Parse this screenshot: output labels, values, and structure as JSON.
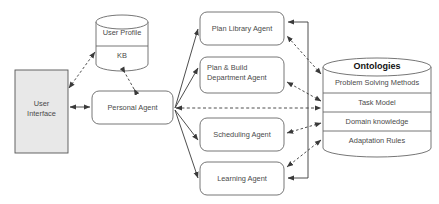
{
  "diagram": {
    "type": "block-diagram",
    "background_color": "#ffffff",
    "stroke_color": "#555555",
    "text_color": "#4a4a4a",
    "fill_color": "#e8e8e8"
  },
  "nodes": {
    "user_interface": {
      "label": "User\nInterface",
      "shape": "rectangle",
      "fill": "#e8e8e8"
    },
    "user_profile_kb": {
      "shape": "cylinder",
      "sections": [
        {
          "label": "User Profile"
        },
        {
          "label": "KB"
        }
      ]
    },
    "personal_agent": {
      "label": "Personal Agent",
      "shape": "rounded-rectangle"
    },
    "plan_library_agent": {
      "label": "Plan Library Agent",
      "shape": "rounded-rectangle"
    },
    "plan_build_department_agent": {
      "label": "Plan & Build\nDepartment Agent",
      "shape": "rounded-rectangle"
    },
    "scheduling_agent": {
      "label": "Scheduling Agent",
      "shape": "rounded-rectangle"
    },
    "learning_agent": {
      "label": "Learning Agent",
      "shape": "rounded-rectangle"
    },
    "ontologies": {
      "title": "Ontologies",
      "shape": "cylinder",
      "sections": [
        {
          "label": "Problem Solving Methods"
        },
        {
          "label": "Task Model"
        },
        {
          "label": "Domain knowledge"
        },
        {
          "label": "Adaptation Rules"
        }
      ]
    }
  },
  "edges": [
    {
      "from": "user_interface",
      "to": "personal_agent",
      "style": "solid",
      "arrows": "both"
    },
    {
      "from": "user_interface",
      "to": "user_profile_kb",
      "style": "dashed",
      "arrows": "both"
    },
    {
      "from": "personal_agent",
      "to": "user_profile_kb",
      "style": "dashed",
      "arrows": "both"
    },
    {
      "from": "personal_agent",
      "to": "plan_library_agent",
      "style": "solid",
      "arrows": "forward"
    },
    {
      "from": "personal_agent",
      "to": "plan_build_department_agent",
      "style": "solid",
      "arrows": "forward"
    },
    {
      "from": "personal_agent",
      "to": "scheduling_agent",
      "style": "solid",
      "arrows": "forward"
    },
    {
      "from": "personal_agent",
      "to": "learning_agent",
      "style": "solid",
      "arrows": "forward"
    },
    {
      "from": "personal_agent",
      "to": "ontologies",
      "style": "dashed",
      "arrows": "both"
    },
    {
      "from": "ontologies",
      "to": "plan_library_agent",
      "style": "dashed",
      "arrows": "both"
    },
    {
      "from": "ontologies",
      "to": "plan_build_department_agent",
      "style": "dashed",
      "arrows": "both"
    },
    {
      "from": "ontologies",
      "to": "scheduling_agent",
      "style": "dashed",
      "arrows": "both"
    },
    {
      "from": "ontologies",
      "to": "learning_agent",
      "style": "dashed",
      "arrows": "both"
    },
    {
      "from": "learning_agent",
      "to": "plan_library_agent",
      "style": "solid",
      "arrows": "both"
    }
  ]
}
